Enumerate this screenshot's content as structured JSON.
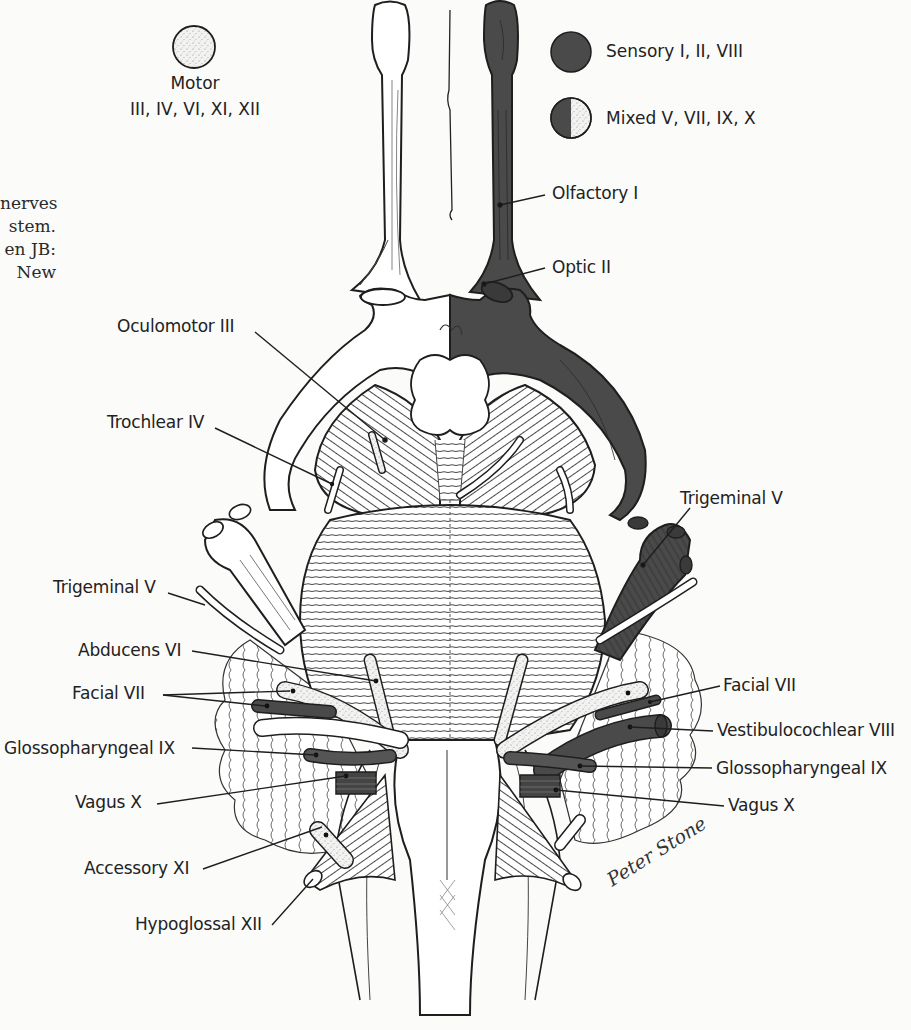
{
  "caption_fragment": [
    "nerves",
    "stem.",
    "en  JB:",
    "New"
  ],
  "legend": {
    "motor": {
      "title": "Motor",
      "nerves": "III, IV, VI, XI, XII",
      "fill": "stippled-light"
    },
    "sensory": {
      "text": "Sensory I, II, VIII",
      "fill": "dark"
    },
    "mixed": {
      "text": "Mixed V, VII, IX, X",
      "fill": "half-dark-half-stippled"
    }
  },
  "labels": {
    "olfactory": "Olfactory I",
    "optic": "Optic II",
    "oculomotor": "Oculomotor III",
    "trochlear": "Trochlear IV",
    "trigeminal_left": "Trigeminal V",
    "trigeminal_right": "Trigeminal V",
    "abducens": "Abducens VI",
    "facial_left": "Facial VII",
    "facial_right": "Facial VII",
    "vestibulocochlear": "Vestibulocochlear VIII",
    "glossopharyngeal_left": "Glossopharyngeal IX",
    "glossopharyngeal_right": "Glossopharyngeal IX",
    "vagus_left": "Vagus X",
    "vagus_right": "Vagus X",
    "accessory": "Accessory XI",
    "hypoglossal": "Hypoglossal XII"
  },
  "signature": "Peter Stone",
  "colors": {
    "background": "#fbfbfa",
    "line": "#1e1e1e",
    "sensory_fill": "#4a4a4a",
    "motor_fill": "#e6e6e4",
    "tissue_fill": "#ffffff"
  }
}
